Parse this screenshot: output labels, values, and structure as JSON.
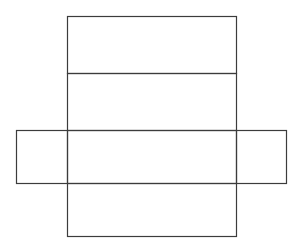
{
  "diagram": {
    "background": "#ffffff",
    "stroke": "#3c3c3c",
    "stroke_width": 1.2,
    "faces": [
      {
        "name": "top-face",
        "x": 67,
        "y": 16,
        "w": 169,
        "h": 57
      },
      {
        "name": "back-face",
        "x": 67,
        "y": 73,
        "w": 169,
        "h": 57
      },
      {
        "name": "bottom-face",
        "x": 67,
        "y": 130,
        "w": 169,
        "h": 53
      },
      {
        "name": "front-face",
        "x": 67,
        "y": 183,
        "w": 169,
        "h": 53
      },
      {
        "name": "left-face",
        "x": 16,
        "y": 130,
        "w": 51,
        "h": 53
      },
      {
        "name": "right-face",
        "x": 236,
        "y": 130,
        "w": 50,
        "h": 53
      }
    ]
  }
}
